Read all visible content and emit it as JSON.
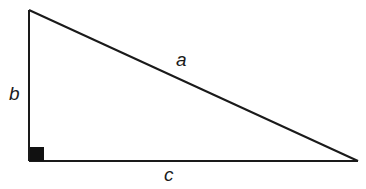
{
  "diagram": {
    "type": "right-triangle",
    "stroke_color": "#1a1a1a",
    "labels": {
      "hypotenuse": "a",
      "vertical_leg": "b",
      "horizontal_leg": "c"
    },
    "right_angle_marker": "filled-square"
  }
}
